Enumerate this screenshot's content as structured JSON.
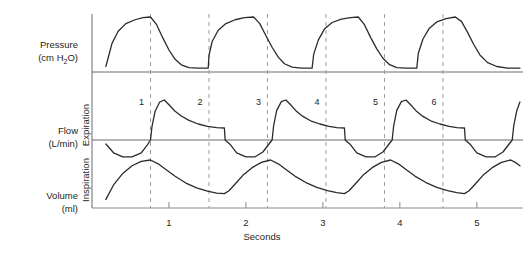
{
  "chart_data": {
    "type": "line",
    "title": "",
    "xlabel": "Seconds",
    "xlim": [
      0,
      5.6
    ],
    "xticks": [
      1,
      2,
      3,
      4,
      5
    ],
    "xticklabels": [
      "1",
      "2",
      "3",
      "4",
      "5"
    ],
    "grid": false,
    "legend": null,
    "annotations": {
      "breath_numbers": [
        "1",
        "2",
        "3",
        "4",
        "5",
        "6"
      ],
      "breath_marker_times": [
        0.76,
        1.52,
        2.28,
        3.04,
        3.8,
        4.56
      ],
      "direction_upper": "Expiration",
      "direction_lower": "Inspiration"
    },
    "panels": [
      {
        "name": "pressure",
        "ylabel_line1": "Pressure",
        "ylabel_line2": "(cm H",
        "ylabel_sub": "2",
        "ylabel_line3": "O)",
        "baseline_value": 0,
        "peak_value": 1.0,
        "plateau_value": 0.07,
        "series": [
          {
            "name": "airway pressure",
            "points": [
              [
                0.18,
                0.1
              ],
              [
                0.26,
                0.52
              ],
              [
                0.34,
                0.74
              ],
              [
                0.44,
                0.88
              ],
              [
                0.56,
                0.95
              ],
              [
                0.66,
                0.99
              ],
              [
                0.76,
                1.0
              ],
              [
                0.84,
                0.86
              ],
              [
                0.92,
                0.62
              ],
              [
                1.0,
                0.4
              ],
              [
                1.08,
                0.23
              ],
              [
                1.16,
                0.13
              ],
              [
                1.26,
                0.08
              ],
              [
                1.38,
                0.07
              ],
              [
                1.5,
                0.07
              ],
              [
                1.51,
                0.07
              ],
              [
                1.52,
                0.3
              ],
              [
                1.56,
                0.55
              ],
              [
                1.64,
                0.76
              ],
              [
                1.74,
                0.88
              ],
              [
                1.86,
                0.95
              ],
              [
                1.98,
                0.99
              ],
              [
                2.1,
                1.0
              ],
              [
                2.18,
                0.88
              ],
              [
                2.26,
                0.66
              ],
              [
                2.34,
                0.45
              ],
              [
                2.42,
                0.27
              ],
              [
                2.5,
                0.15
              ],
              [
                2.6,
                0.09
              ],
              [
                2.72,
                0.07
              ],
              [
                2.84,
                0.07
              ],
              [
                2.86,
                0.07
              ],
              [
                2.88,
                0.32
              ],
              [
                2.94,
                0.58
              ],
              [
                3.02,
                0.78
              ],
              [
                3.12,
                0.9
              ],
              [
                3.24,
                0.96
              ],
              [
                3.36,
                0.99
              ],
              [
                3.46,
                1.0
              ],
              [
                3.54,
                0.86
              ],
              [
                3.62,
                0.63
              ],
              [
                3.7,
                0.42
              ],
              [
                3.78,
                0.25
              ],
              [
                3.86,
                0.14
              ],
              [
                3.96,
                0.08
              ],
              [
                4.08,
                0.07
              ],
              [
                4.2,
                0.07
              ],
              [
                4.22,
                0.07
              ],
              [
                4.24,
                0.34
              ],
              [
                4.3,
                0.6
              ],
              [
                4.38,
                0.79
              ],
              [
                4.48,
                0.91
              ],
              [
                4.6,
                0.97
              ],
              [
                4.72,
                1.0
              ],
              [
                4.8,
                0.92
              ],
              [
                4.88,
                0.72
              ],
              [
                4.96,
                0.5
              ],
              [
                5.04,
                0.31
              ],
              [
                5.14,
                0.17
              ],
              [
                5.26,
                0.1
              ],
              [
                5.4,
                0.07
              ],
              [
                5.56,
                0.07
              ]
            ]
          }
        ]
      },
      {
        "name": "flow",
        "ylabel_line1": "Flow",
        "ylabel_line2": "(L/min)",
        "baseline_value": 0,
        "peak_expiratory": 1.0,
        "plateau_expiratory": 0.3,
        "peak_inspiratory": -0.42,
        "series": [
          {
            "name": "airway flow",
            "points": [
              [
                0.18,
                -0.1
              ],
              [
                0.28,
                -0.32
              ],
              [
                0.4,
                -0.42
              ],
              [
                0.52,
                -0.42
              ],
              [
                0.64,
                -0.32
              ],
              [
                0.72,
                -0.12
              ],
              [
                0.76,
                0.0
              ],
              [
                0.78,
                0.34
              ],
              [
                0.82,
                0.72
              ],
              [
                0.88,
                0.95
              ],
              [
                0.94,
                1.0
              ],
              [
                1.0,
                0.88
              ],
              [
                1.08,
                0.72
              ],
              [
                1.16,
                0.6
              ],
              [
                1.26,
                0.49
              ],
              [
                1.38,
                0.4
              ],
              [
                1.5,
                0.34
              ],
              [
                1.62,
                0.31
              ],
              [
                1.72,
                0.3
              ],
              [
                1.73,
                0.0
              ],
              [
                1.8,
                -0.12
              ],
              [
                1.88,
                -0.32
              ],
              [
                2.0,
                -0.42
              ],
              [
                2.12,
                -0.42
              ],
              [
                2.22,
                -0.3
              ],
              [
                2.3,
                -0.1
              ],
              [
                2.34,
                0.0
              ],
              [
                2.36,
                0.36
              ],
              [
                2.4,
                0.74
              ],
              [
                2.46,
                0.96
              ],
              [
                2.52,
                1.0
              ],
              [
                2.58,
                0.88
              ],
              [
                2.66,
                0.71
              ],
              [
                2.74,
                0.59
              ],
              [
                2.84,
                0.48
              ],
              [
                2.96,
                0.4
              ],
              [
                3.08,
                0.34
              ],
              [
                3.18,
                0.31
              ],
              [
                3.28,
                0.3
              ],
              [
                3.29,
                0.0
              ],
              [
                3.36,
                -0.12
              ],
              [
                3.44,
                -0.32
              ],
              [
                3.56,
                -0.42
              ],
              [
                3.68,
                -0.42
              ],
              [
                3.78,
                -0.3
              ],
              [
                3.86,
                -0.1
              ],
              [
                3.9,
                0.0
              ],
              [
                3.92,
                0.36
              ],
              [
                3.96,
                0.74
              ],
              [
                4.02,
                0.96
              ],
              [
                4.08,
                1.0
              ],
              [
                4.14,
                0.88
              ],
              [
                4.22,
                0.71
              ],
              [
                4.3,
                0.59
              ],
              [
                4.4,
                0.48
              ],
              [
                4.52,
                0.4
              ],
              [
                4.64,
                0.34
              ],
              [
                4.74,
                0.31
              ],
              [
                4.84,
                0.3
              ],
              [
                4.85,
                0.0
              ],
              [
                4.92,
                -0.12
              ],
              [
                5.0,
                -0.32
              ],
              [
                5.12,
                -0.42
              ],
              [
                5.24,
                -0.42
              ],
              [
                5.34,
                -0.3
              ],
              [
                5.42,
                -0.1
              ],
              [
                5.46,
                0.0
              ],
              [
                5.48,
                0.36
              ],
              [
                5.52,
                0.74
              ],
              [
                5.56,
                0.95
              ]
            ]
          }
        ]
      },
      {
        "name": "volume",
        "ylabel_line1": "Volume",
        "ylabel_line2": "(ml)",
        "baseline_value": 0,
        "peak_value": 1.0,
        "trough_value": 0.3,
        "series": [
          {
            "name": "tidal volume",
            "points": [
              [
                0.18,
                0.18
              ],
              [
                0.28,
                0.48
              ],
              [
                0.4,
                0.72
              ],
              [
                0.52,
                0.88
              ],
              [
                0.64,
                0.97
              ],
              [
                0.76,
                1.0
              ],
              [
                0.86,
                0.92
              ],
              [
                0.96,
                0.8
              ],
              [
                1.08,
                0.66
              ],
              [
                1.22,
                0.52
              ],
              [
                1.36,
                0.42
              ],
              [
                1.5,
                0.35
              ],
              [
                1.62,
                0.31
              ],
              [
                1.72,
                0.3
              ],
              [
                1.78,
                0.36
              ],
              [
                1.86,
                0.5
              ],
              [
                1.96,
                0.68
              ],
              [
                2.08,
                0.84
              ],
              [
                2.2,
                0.95
              ],
              [
                2.32,
                1.0
              ],
              [
                2.42,
                0.92
              ],
              [
                2.52,
                0.8
              ],
              [
                2.64,
                0.66
              ],
              [
                2.78,
                0.53
              ],
              [
                2.92,
                0.43
              ],
              [
                3.06,
                0.36
              ],
              [
                3.18,
                0.32
              ],
              [
                3.28,
                0.3
              ],
              [
                3.34,
                0.36
              ],
              [
                3.42,
                0.5
              ],
              [
                3.52,
                0.68
              ],
              [
                3.64,
                0.84
              ],
              [
                3.76,
                0.95
              ],
              [
                3.88,
                1.0
              ],
              [
                3.98,
                0.92
              ],
              [
                4.08,
                0.8
              ],
              [
                4.2,
                0.66
              ],
              [
                4.34,
                0.53
              ],
              [
                4.48,
                0.43
              ],
              [
                4.62,
                0.36
              ],
              [
                4.74,
                0.32
              ],
              [
                4.84,
                0.3
              ],
              [
                4.9,
                0.36
              ],
              [
                4.98,
                0.5
              ],
              [
                5.08,
                0.68
              ],
              [
                5.2,
                0.84
              ],
              [
                5.32,
                0.95
              ],
              [
                5.44,
                1.0
              ],
              [
                5.5,
                0.95
              ],
              [
                5.56,
                0.88
              ]
            ]
          }
        ]
      }
    ]
  },
  "labels": {
    "pressure_l1": "Pressure",
    "pressure_l2a": "(cm H",
    "pressure_sub": "2",
    "pressure_l2b": "O)",
    "flow_l1": "Flow",
    "flow_l2": "(L/min)",
    "volume_l1": "Volume",
    "volume_l2": "(ml)",
    "expiration": "Expiration",
    "inspiration": "Inspiration",
    "seconds": "Seconds",
    "tick1": "1",
    "tick2": "2",
    "tick3": "3",
    "tick4": "4",
    "tick5": "5",
    "breath1": "1",
    "breath2": "2",
    "breath3": "3",
    "breath4": "4",
    "breath5": "5",
    "breath6": "6"
  },
  "colors": {
    "wave": "#2b2b2b",
    "axis": "#6b6b6b",
    "dashed": "#9a9a9a",
    "text": "#231f20",
    "background": "#ffffff"
  }
}
